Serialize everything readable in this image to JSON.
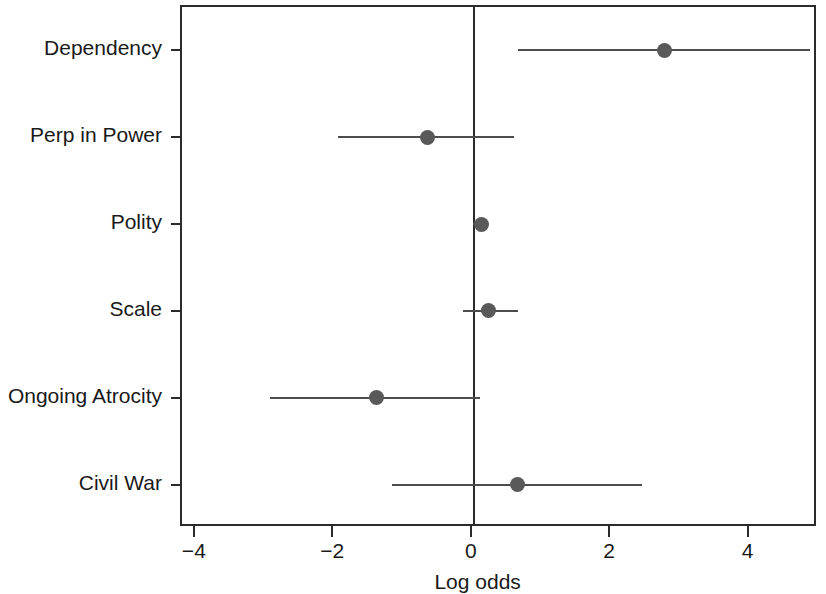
{
  "chart_data": {
    "type": "scatter",
    "subtype": "forest-plot",
    "title": "",
    "xlabel": "Log odds",
    "ylabel": "",
    "xlim": [
      -4.2,
      4.93
    ],
    "ylim": [
      0,
      6
    ],
    "grid": false,
    "legend": null,
    "xticks": [
      -4,
      -2,
      0,
      2,
      4
    ],
    "xticklabels": [
      "−4",
      "−2",
      "0",
      "2",
      "4"
    ],
    "reference_line": 0,
    "categories": [
      "Dependency",
      "Perp in Power",
      "Polity",
      "Scale",
      "Ongoing Atrocity",
      "Civil War"
    ],
    "points": [
      {
        "label": "Dependency",
        "estimate": 2.77,
        "ci_low": 0.65,
        "ci_high": 4.87
      },
      {
        "label": "Perp in Power",
        "estimate": -0.66,
        "ci_low": -1.94,
        "ci_high": 0.59
      },
      {
        "label": "Polity",
        "estimate": 0.13,
        "ci_low": 0.0,
        "ci_high": 0.19
      },
      {
        "label": "Scale",
        "estimate": 0.23,
        "ci_low": -0.14,
        "ci_high": 0.65
      },
      {
        "label": "Ongoing Atrocity",
        "estimate": -1.39,
        "ci_low": -2.93,
        "ci_high": 0.11
      },
      {
        "label": "Civil War",
        "estimate": 0.65,
        "ci_low": -1.16,
        "ci_high": 2.44
      }
    ],
    "colors": {
      "point": "#595959",
      "interval": "#4d4d4d",
      "axis": "#2b2b2b",
      "background": "#ffffff",
      "text": "#1a1a1a"
    }
  }
}
